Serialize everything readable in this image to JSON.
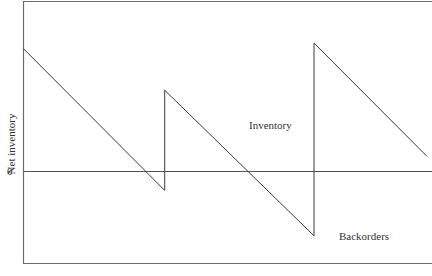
{
  "chart_data": {
    "type": "line",
    "title": "",
    "xlabel": "",
    "ylabel": "Net inventory",
    "y_ticks": [
      "0"
    ],
    "grid": false,
    "legend": null,
    "annotations": [
      {
        "text": "Inventory",
        "position": "above zero line, mid-chart"
      },
      {
        "text": "Backorders",
        "position": "below zero line, lower right"
      }
    ],
    "series": [
      {
        "name": "Net inventory",
        "points": [
          {
            "x": 0.0,
            "y": 6.5
          },
          {
            "x": 3.5,
            "y": -1.0
          },
          {
            "x": 3.5,
            "y": 4.3
          },
          {
            "x": 7.2,
            "y": -3.4
          },
          {
            "x": 7.2,
            "y": 6.8
          },
          {
            "x": 10.0,
            "y": 0.8
          }
        ]
      }
    ],
    "xlim": [
      0,
      10
    ],
    "ylim": [
      -4.8,
      8.9
    ]
  },
  "labels": {
    "ylabel": "Net inventory",
    "zero_tick": "0",
    "inventory": "Inventory",
    "backorders": "Backorders"
  }
}
